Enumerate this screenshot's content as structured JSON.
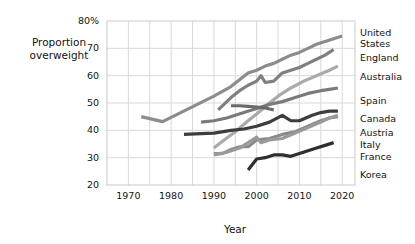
{
  "chart_data": {
    "type": "line",
    "title": "",
    "xlabel": "Year",
    "ylabel": "Proportion\noverweight",
    "xlim": [
      1965,
      2023
    ],
    "ylim": [
      20,
      80
    ],
    "xticks": [
      1970,
      1980,
      1990,
      2000,
      2010,
      2020
    ],
    "yticks": [
      20,
      30,
      40,
      50,
      60,
      70,
      80
    ],
    "ytick_labels": [
      "20",
      "30",
      "40",
      "50",
      "60",
      "70",
      "80%"
    ],
    "grid": true,
    "grid_interval_x": 5,
    "grid_interval_y": 10,
    "legend_position": "right-inline",
    "y_unit": "%",
    "series": [
      {
        "name": "United States",
        "color": "#8c8c8c",
        "label_top_px": 28,
        "x": [
          1973,
          1978,
          1990,
          1994,
          1998,
          2000,
          2002,
          2004,
          2006,
          2008,
          2010,
          2012,
          2014,
          2016,
          2018,
          2020
        ],
        "y": [
          45.0,
          43.2,
          52.5,
          56.0,
          61.0,
          62.0,
          63.5,
          64.5,
          66.0,
          67.5,
          68.5,
          70.0,
          71.5,
          72.5,
          73.5,
          74.5
        ]
      },
      {
        "name": "England",
        "color": "#7f7f7f",
        "label_top_px": 53,
        "x": [
          1991,
          1994,
          1996,
          1998,
          2000,
          2001,
          2002,
          2004,
          2006,
          2008,
          2010,
          2012,
          2014,
          2016,
          2018
        ],
        "y": [
          47.5,
          52.0,
          54.5,
          56.5,
          58.0,
          60.0,
          57.5,
          58.0,
          61.0,
          62.0,
          63.0,
          64.5,
          66.0,
          67.5,
          69.5
        ]
      },
      {
        "name": "Australia",
        "color": "#aaaaaa",
        "label_top_px": 72,
        "x": [
          1990,
          1992,
          1995,
          1998,
          2000,
          2003,
          2005,
          2008,
          2011,
          2014,
          2017,
          2019
        ],
        "y": [
          33.5,
          36.0,
          39.5,
          43.5,
          46.0,
          50.0,
          52.5,
          55.5,
          58.0,
          60.0,
          62.0,
          63.5
        ]
      },
      {
        "name": "Spain",
        "color": "#7a7a7a",
        "label_top_px": 96,
        "x": [
          1987,
          1990,
          1993,
          1995,
          1997,
          2000,
          2003,
          2006,
          2009,
          2012,
          2015,
          2017,
          2019
        ],
        "y": [
          43.0,
          43.5,
          44.5,
          45.5,
          46.5,
          48.0,
          49.5,
          50.5,
          52.0,
          53.5,
          54.5,
          55.0,
          55.5
        ]
      },
      {
        "name": "Canada",
        "color": "#6a6a6a",
        "label_top_px": 114,
        "x": [
          1994,
          1996,
          1998,
          2000,
          2002,
          2003,
          2004
        ],
        "y": [
          49.0,
          49.0,
          48.8,
          48.5,
          48.2,
          47.8,
          47.5
        ]
      },
      {
        "name": "Austria",
        "color": "#3d3d3d",
        "label_top_px": 128,
        "x": [
          1983,
          1987,
          1990,
          1994,
          1997,
          2000,
          2003,
          2006,
          2008,
          2010,
          2013,
          2015,
          2017,
          2019
        ],
        "y": [
          38.5,
          38.8,
          39.0,
          40.0,
          40.5,
          41.5,
          43.0,
          45.5,
          43.5,
          43.5,
          45.5,
          46.5,
          47.0,
          47.0
        ]
      },
      {
        "name": "Italy",
        "color": "#8a8a8a",
        "label_top_px": 140,
        "x": [
          1990,
          1992,
          1994,
          1996,
          1998,
          2000,
          2003,
          2006,
          2009,
          2012,
          2015,
          2017,
          2019
        ],
        "y": [
          31.5,
          31.5,
          33.0,
          34.0,
          34.0,
          36.5,
          37.0,
          38.5,
          39.5,
          41.5,
          43.5,
          44.5,
          45.0
        ]
      },
      {
        "name": "France",
        "color": "#9a9a9a",
        "label_top_px": 152,
        "x": [
          1990,
          1993,
          1996,
          1998,
          2000,
          2001,
          2003,
          2006,
          2009,
          2012,
          2015,
          2017,
          2019
        ],
        "y": [
          31.0,
          32.0,
          33.5,
          35.5,
          37.5,
          35.5,
          36.5,
          37.0,
          39.0,
          41.0,
          43.0,
          44.5,
          45.5
        ]
      },
      {
        "name": "Korea",
        "color": "#2e2e2e",
        "label_top_px": 170,
        "x": [
          1998,
          2000,
          2002,
          2004,
          2006,
          2008,
          2010,
          2012,
          2014,
          2016,
          2018
        ],
        "y": [
          25.5,
          29.5,
          30.0,
          31.0,
          31.0,
          30.5,
          31.5,
          32.5,
          33.5,
          34.5,
          35.5
        ]
      }
    ]
  },
  "axes": {
    "x_title": "Year",
    "y_title": "Proportion\noverweight",
    "x_tick_labels": [
      "1970",
      "1980",
      "1990",
      "2000",
      "2010",
      "2020"
    ],
    "y_tick_labels": [
      "20",
      "30",
      "40",
      "50",
      "60",
      "70",
      "80%"
    ]
  },
  "style": {
    "plot_background": "#ffffff",
    "grid_color": "#d9d9d9",
    "frame_color": "#c9c9c9",
    "text_color": "#131313"
  }
}
